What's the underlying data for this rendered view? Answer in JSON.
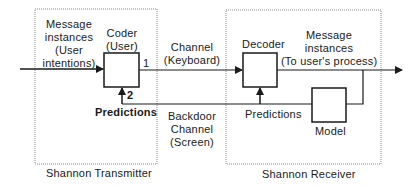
{
  "diagram": {
    "transmitter": {
      "title": "Shannon Transmitter",
      "input_label_lines": [
        "Message",
        "instances",
        "(User",
        "intentions)"
      ],
      "coder_label_lines": [
        "Coder",
        "(User)"
      ],
      "feedback_label": "Predictions",
      "port_out": "1",
      "port_in": "2"
    },
    "channel": {
      "forward_label_lines": [
        "Channel",
        "(Keyboard)"
      ],
      "backdoor_label_lines": [
        "Backdoor",
        "Channel",
        "(Screen)"
      ]
    },
    "receiver": {
      "title": "Shannon Receiver",
      "decoder_label": "Decoder",
      "output_label_lines": [
        "Message",
        "instances",
        "(To user's process)"
      ],
      "predictions_label": "Predictions",
      "model_label": "Model"
    },
    "colors": {
      "line": "#1a1a1a",
      "dotted_border": "#8a8a8a",
      "background": "#ffffff"
    }
  }
}
